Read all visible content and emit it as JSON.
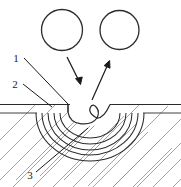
{
  "figure": {
    "width": 181,
    "height": 187,
    "background_color": "#ffffff",
    "line_color": "#2b2b2b",
    "hatch_color": "#8a8a8a",
    "callout_labels": [
      {
        "id": "label-1",
        "text": "1",
        "x": 19,
        "y": 61
      },
      {
        "id": "label-2",
        "text": "2",
        "x": 17,
        "y": 87
      },
      {
        "id": "label-3",
        "text": "3",
        "x": 31,
        "y": 178
      }
    ],
    "elements": {
      "circle_left_name": "electrode-circle-left",
      "circle_right_name": "electrode-circle-right",
      "arrow_left_name": "incidence-arrow-left",
      "arrow_right_name": "incidence-arrow-right",
      "surface_name": "workpiece-surface-line",
      "crater_name": "weld-crater-profile",
      "arcs_name": "heat-affected-zone-arcs",
      "hatch_name": "section-hatching"
    }
  }
}
